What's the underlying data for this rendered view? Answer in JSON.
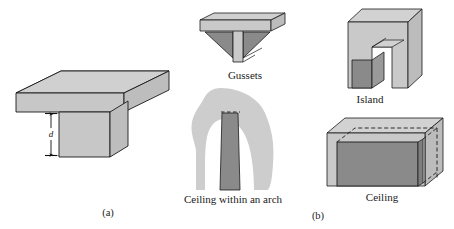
{
  "figure": {
    "background_color": "#ffffff",
    "colors": {
      "face_light": "#c9c9c9",
      "face_top": "#cfcfcf",
      "face_side": "#bcbcbc",
      "fill_dark": "#8a8a8a",
      "arch_silhouette": "#cdcdcd",
      "outline": "#1a1a1a",
      "text": "#1a1a1a"
    },
    "panels": [
      {
        "id": "panel-a",
        "sublabel": "(a)",
        "description": "T-shaped beam in isometric view with depth dimension",
        "dimension_label": "d"
      },
      {
        "id": "panel-b",
        "sublabel": "(b)",
        "description": "Four T-section geometry variants",
        "items": [
          {
            "id": "gussets",
            "label": "Gussets"
          },
          {
            "id": "ceiling-within-arch",
            "label": "Ceiling within an arch"
          },
          {
            "id": "island",
            "label": "Island"
          },
          {
            "id": "ceiling",
            "label": "Ceiling"
          }
        ]
      }
    ]
  }
}
